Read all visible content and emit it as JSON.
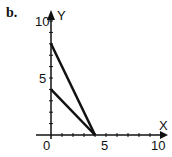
{
  "panel_label": "b.",
  "chart_data": {
    "type": "line",
    "title": "",
    "xlabel": "X",
    "ylabel": "Y",
    "xlim": [
      0,
      10
    ],
    "ylim": [
      0,
      10
    ],
    "x_ticks": [
      0,
      5,
      10
    ],
    "y_ticks": [
      5,
      10
    ],
    "x_tick_labels": [
      "0",
      "5",
      "10"
    ],
    "y_tick_labels": [
      "5",
      "10"
    ],
    "grid": false,
    "legend": false,
    "series": [
      {
        "name": "line-1",
        "x": [
          0,
          4
        ],
        "y": [
          8,
          0
        ]
      },
      {
        "name": "line-2",
        "x": [
          0,
          4
        ],
        "y": [
          4,
          0
        ]
      }
    ]
  },
  "colors": {
    "axis": "#111111",
    "line": "#111111"
  }
}
